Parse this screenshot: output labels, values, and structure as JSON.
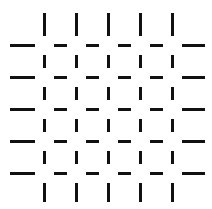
{
  "figure": {
    "background": "#ffffff",
    "line_color": "#111111",
    "thickness": 3,
    "gap": 8,
    "vertical_x": [
      43,
      75,
      107,
      139,
      171
    ],
    "horizontal_y": [
      44,
      76,
      108,
      140,
      172
    ],
    "horizontal_extent": [
      10,
      205
    ],
    "vertical_extent": [
      13,
      202
    ]
  }
}
